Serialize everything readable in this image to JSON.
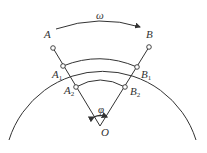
{
  "diagram": {
    "labels": {
      "omega": "ω",
      "A": "A",
      "B": "B",
      "A1": {
        "base": "A",
        "sub": "1"
      },
      "B1": {
        "base": "B",
        "sub": "1"
      },
      "A2": {
        "base": "A",
        "sub": "2"
      },
      "B2": {
        "base": "B",
        "sub": "2"
      },
      "phi": "φ",
      "O": "O"
    },
    "colors": {
      "stroke": "#333333",
      "background": "#ffffff"
    }
  }
}
